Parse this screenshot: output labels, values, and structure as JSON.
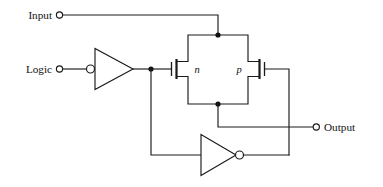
{
  "figure": {
    "name": "cmos-transmission-gate-schematic",
    "background_color": "#ffffff",
    "line_color": "#1a1a1a",
    "width": 383,
    "height": 187
  },
  "ports": {
    "input": {
      "label": "Input",
      "terminal_icon": "open-circle-terminal"
    },
    "logic": {
      "label": "Logic",
      "terminal_icon": "open-circle-terminal"
    },
    "output": {
      "label": "Output",
      "terminal_icon": "open-circle-terminal"
    }
  },
  "devices": {
    "nmos": {
      "label": "n",
      "type": "n-channel-mosfet"
    },
    "pmos": {
      "label": "p",
      "type": "p-channel-mosfet"
    },
    "inverter_1": {
      "type": "inverter",
      "bubble_side": "input"
    },
    "inverter_2": {
      "type": "inverter",
      "bubble_side": "output"
    }
  },
  "nodes": {
    "top_junction": "transmission-gate-top-node",
    "bottom_junction": "transmission-gate-bottom-node",
    "logic_junction": "inverter1-output-node"
  }
}
